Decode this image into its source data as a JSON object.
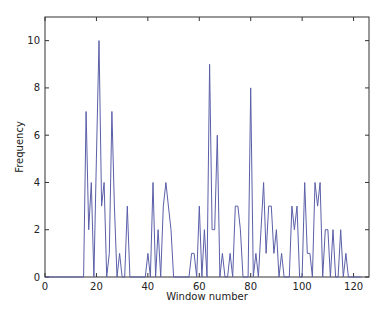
{
  "chart_data": {
    "type": "line",
    "title": "",
    "xlabel": "Window number",
    "ylabel": "Frequency",
    "xlim": [
      0,
      126
    ],
    "ylim": [
      0,
      11
    ],
    "xticks": [
      0,
      20,
      40,
      60,
      80,
      100,
      120
    ],
    "yticks": [
      0,
      2,
      4,
      6,
      8,
      10
    ],
    "grid": false,
    "legend": null,
    "line_color": "#5b5fa8",
    "series": [
      {
        "name": "frequency",
        "x": [
          0,
          1,
          2,
          3,
          4,
          5,
          6,
          7,
          8,
          9,
          10,
          11,
          12,
          13,
          14,
          15,
          16,
          17,
          18,
          19,
          20,
          21,
          22,
          23,
          24,
          25,
          26,
          27,
          28,
          29,
          30,
          31,
          32,
          33,
          34,
          35,
          36,
          37,
          38,
          39,
          40,
          41,
          42,
          43,
          44,
          45,
          46,
          47,
          48,
          49,
          50,
          51,
          52,
          53,
          54,
          55,
          56,
          57,
          58,
          59,
          60,
          61,
          62,
          63,
          64,
          65,
          66,
          67,
          68,
          69,
          70,
          71,
          72,
          73,
          74,
          75,
          76,
          77,
          78,
          79,
          80,
          81,
          82,
          83,
          84,
          85,
          86,
          87,
          88,
          89,
          90,
          91,
          92,
          93,
          94,
          95,
          96,
          97,
          98,
          99,
          100,
          101,
          102,
          103,
          104,
          105,
          106,
          107,
          108,
          109,
          110,
          111,
          112,
          113,
          114,
          115,
          116,
          117,
          118,
          119,
          120,
          121,
          122,
          123
        ],
        "values": [
          0,
          0,
          0,
          0,
          0,
          0,
          0,
          0,
          0,
          0,
          0,
          0,
          0,
          0,
          0,
          0,
          7,
          2,
          4,
          0,
          5,
          10,
          3,
          4,
          0,
          1,
          7,
          3,
          0,
          1,
          0,
          0,
          3,
          0,
          0,
          0,
          0,
          0,
          0,
          0,
          1,
          0,
          4,
          0,
          2,
          0,
          3,
          4,
          3,
          2,
          0,
          0,
          0,
          0,
          0,
          0,
          0,
          1,
          1,
          0,
          3,
          0,
          2,
          0,
          9,
          2,
          2,
          6,
          0,
          1,
          0,
          0,
          1,
          0,
          3,
          3,
          2,
          0,
          0,
          0,
          8,
          0,
          1,
          0,
          2,
          4,
          1,
          3,
          3,
          1,
          2,
          0,
          1,
          0,
          0,
          0,
          3,
          2,
          3,
          0,
          0,
          4,
          1,
          1,
          0,
          4,
          3,
          4,
          0,
          2,
          2,
          0,
          2,
          0,
          0,
          2,
          0,
          1,
          0,
          0,
          0,
          0,
          0,
          0
        ]
      }
    ]
  }
}
